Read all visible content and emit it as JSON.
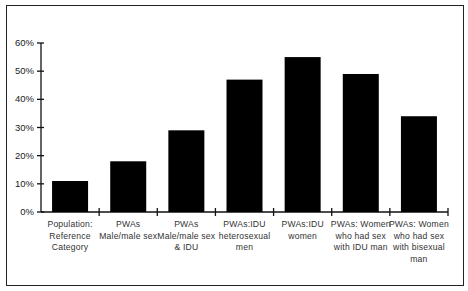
{
  "chart_data": {
    "type": "bar",
    "title": "",
    "xlabel": "",
    "ylabel": "",
    "ylim": [
      0,
      60
    ],
    "yticks": [
      "0%",
      "10%",
      "20%",
      "30%",
      "40%",
      "50%",
      "60%"
    ],
    "grid": false,
    "legend": null,
    "categories": [
      "Population: Reference Category",
      "PWAs Male/male sex",
      "PWAs Male/male sex & IDU",
      "PWAs:IDU heterosexual men",
      "PWAs:IDU women",
      "PWAs: Women who had sex with IDU man",
      "PWAs: Women who had sex with bisexual man"
    ],
    "category_lines": [
      [
        "Population:",
        "Reference",
        "Category"
      ],
      [
        "PWAs",
        "Male/male sex"
      ],
      [
        "PWAs",
        "Male/male sex",
        "& IDU"
      ],
      [
        "PWAs:IDU",
        "heterosexual",
        "men"
      ],
      [
        "PWAs:IDU",
        "women"
      ],
      [
        "PWAs: Women",
        "who had sex",
        "with IDU man"
      ],
      [
        "PWAs: Women",
        "who had sex",
        "with bisexual",
        "man"
      ]
    ],
    "values": [
      11,
      18,
      29,
      47,
      55,
      49,
      34
    ],
    "unit": "%",
    "bar_color": "#000000"
  }
}
